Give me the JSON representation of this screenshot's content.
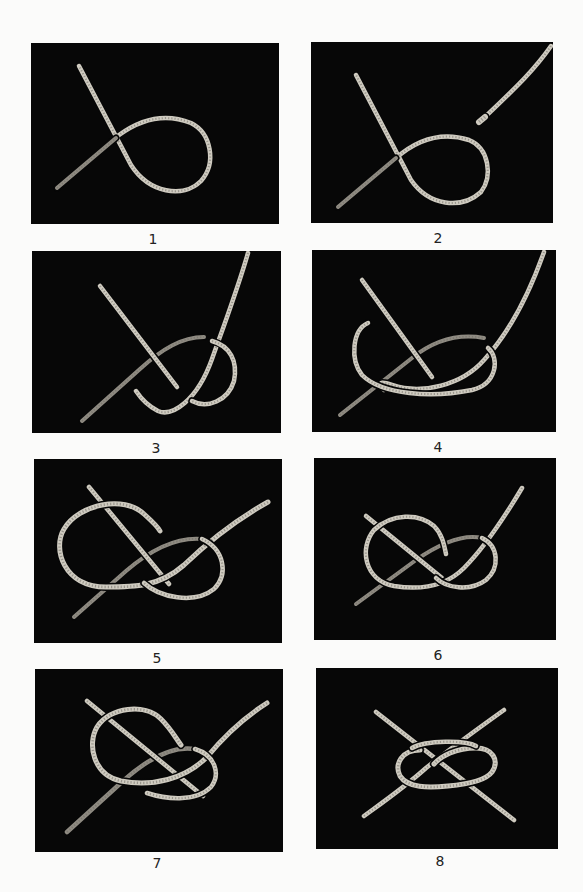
{
  "figure": {
    "background": "#fbfbfa",
    "panel_background": "#070707",
    "rope_color": "#cfcbc0",
    "rope_shade": "#8f8b82",
    "panels": [
      {
        "label": "1",
        "box": {
          "x": 31,
          "y": 43,
          "w": 248,
          "h": 181
        },
        "caption_pos": {
          "x": 133,
          "y": 231
        },
        "ropes": [
          {
            "d": "M26 145 L88 92 C110 76 135 70 160 80 C180 90 186 120 170 138 C152 156 118 150 100 122 L48 23",
            "w": 4.5
          },
          {
            "d": "M26 145 L85 95",
            "w": 4,
            "shade": true
          }
        ]
      },
      {
        "label": "2",
        "box": {
          "x": 311,
          "y": 42,
          "w": 242,
          "h": 181
        },
        "caption_pos": {
          "x": 418,
          "y": 230
        },
        "ropes": [
          {
            "d": "M27 165 L85 116 C108 96 133 90 158 98 C178 106 182 134 170 150 C150 168 118 164 100 138 L45 33",
            "w": 4.5
          },
          {
            "d": "M27 165 L85 116",
            "w": 4,
            "shade": true
          },
          {
            "d": "M240 4 C222 30 200 50 174 75",
            "w": 4.5
          },
          {
            "d": "M174 75 L168 80",
            "w": 6
          }
        ]
      },
      {
        "label": "3",
        "box": {
          "x": 32,
          "y": 251,
          "w": 249,
          "h": 182
        },
        "caption_pos": {
          "x": 136,
          "y": 440
        },
        "ropes": [
          {
            "d": "M50 170 L108 118 C130 98 150 86 172 86",
            "w": 4,
            "shade": true
          },
          {
            "d": "M68 35 L145 136",
            "w": 4.5
          },
          {
            "d": "M216 2 C205 40 190 80 180 108 C165 150 140 166 126 160 C114 154 108 146 104 140",
            "w": 4.5
          },
          {
            "d": "M180 90 C198 95 206 110 202 130 C196 150 175 158 160 150",
            "w": 4.5
          }
        ]
      },
      {
        "label": "4",
        "box": {
          "x": 312,
          "y": 250,
          "w": 244,
          "h": 182
        },
        "caption_pos": {
          "x": 418,
          "y": 439
        },
        "ropes": [
          {
            "d": "M28 165 L100 108 C125 88 150 84 172 88",
            "w": 4,
            "shade": true
          },
          {
            "d": "M50 30 L120 127",
            "w": 4.5
          },
          {
            "d": "M232 2 C215 50 195 85 172 110 C150 135 110 145 80 135 C60 128 72 140 72 140",
            "w": 4.5
          },
          {
            "d": "M56 73 C40 80 38 110 50 125 C70 145 120 148 160 140 C185 134 188 108 176 98",
            "w": 4.5
          }
        ]
      },
      {
        "label": "5",
        "box": {
          "x": 34,
          "y": 459,
          "w": 248,
          "h": 184
        },
        "caption_pos": {
          "x": 137,
          "y": 650
        },
        "ropes": [
          {
            "d": "M40 158 L92 112 C120 88 145 78 168 80",
            "w": 4,
            "shade": true
          },
          {
            "d": "M55 28 L135 125",
            "w": 4.5
          },
          {
            "d": "M234 43 C200 62 175 82 150 106 C125 128 100 128 72 128 C30 128 18 90 30 70 C45 45 90 36 110 55 C120 64 124 68 126 72",
            "w": 5
          },
          {
            "d": "M168 80 C190 90 195 115 180 130 C160 146 125 138 110 124",
            "w": 4.5
          }
        ]
      },
      {
        "label": "6",
        "box": {
          "x": 314,
          "y": 458,
          "w": 242,
          "h": 182
        },
        "caption_pos": {
          "x": 418,
          "y": 647
        },
        "ropes": [
          {
            "d": "M42 146 L102 102 C128 84 150 76 168 80",
            "w": 4,
            "shade": true
          },
          {
            "d": "M52 58 L128 120",
            "w": 4.5
          },
          {
            "d": "M208 30 C190 60 170 90 150 110 C130 130 105 132 80 128 C50 122 45 90 60 72 C78 55 105 55 120 68 C128 76 130 86 132 96",
            "w": 4.5
          },
          {
            "d": "M168 80 C185 88 186 110 172 122 C156 134 132 130 122 120",
            "w": 4.5
          }
        ]
      },
      {
        "label": "7",
        "box": {
          "x": 35,
          "y": 669,
          "w": 248,
          "h": 183
        },
        "caption_pos": {
          "x": 137,
          "y": 855
        },
        "ropes": [
          {
            "d": "M32 163 L88 112 C108 94 135 76 160 80",
            "w": 4.5,
            "shade": true
          },
          {
            "d": "M52 32 L168 127",
            "w": 4.5
          },
          {
            "d": "M232 34 C210 48 190 66 172 88 C150 110 118 118 86 112 C58 106 52 75 62 58 C75 38 110 34 126 50 C136 60 140 68 146 76",
            "w": 5
          },
          {
            "d": "M160 80 C180 86 186 105 176 118 C160 134 130 130 112 124",
            "w": 4.5
          }
        ]
      },
      {
        "label": "8",
        "box": {
          "x": 316,
          "y": 668,
          "w": 242,
          "h": 181
        },
        "caption_pos": {
          "x": 420,
          "y": 853
        },
        "ropes": [
          {
            "d": "M60 44 L198 152",
            "w": 4.5
          },
          {
            "d": "M48 148 C70 132 90 118 110 100 C130 84 160 62 188 42",
            "w": 4.5
          },
          {
            "d": "M104 82 C86 82 78 96 84 108 C92 120 112 120 132 118 C155 116 170 112 176 104 C184 92 176 80 160 80 C140 80 125 88 118 96",
            "w": 5
          },
          {
            "d": "M96 80 C110 72 150 72 160 78",
            "w": 4.5
          }
        ]
      }
    ]
  }
}
